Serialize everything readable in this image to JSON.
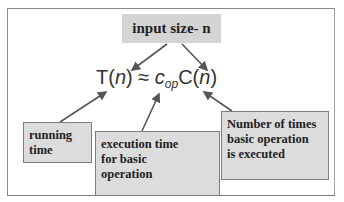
{
  "diagram": {
    "top_label": "input size- n",
    "formula": {
      "lhs": "T",
      "lhs_arg": "n",
      "approx": "≈",
      "coef": "c",
      "coef_sub": "op",
      "rhs": "C",
      "rhs_arg": "n"
    },
    "boxes": {
      "running_time": [
        "running",
        "time"
      ],
      "execution_time": [
        "execution time",
        "for basic",
        "operation"
      ],
      "number_of_times": [
        "Number of times",
        "basic operation",
        "is executed"
      ]
    },
    "colors": {
      "box_fill": "#dcdcdc",
      "box_border": "#7d7d7d",
      "arrow": "#555555",
      "text": "#222222"
    }
  }
}
